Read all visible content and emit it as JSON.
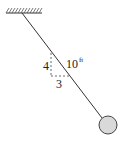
{
  "diagram": {
    "labels": {
      "vertical_leg": "4",
      "horizontal_leg": "3",
      "rope_length_value": "10",
      "rope_length_unit": "ft"
    },
    "colors": {
      "line": "#333333",
      "bob_fill": "#d9d9d9",
      "bob_stroke": "#444444",
      "dashed": "#444444"
    }
  }
}
